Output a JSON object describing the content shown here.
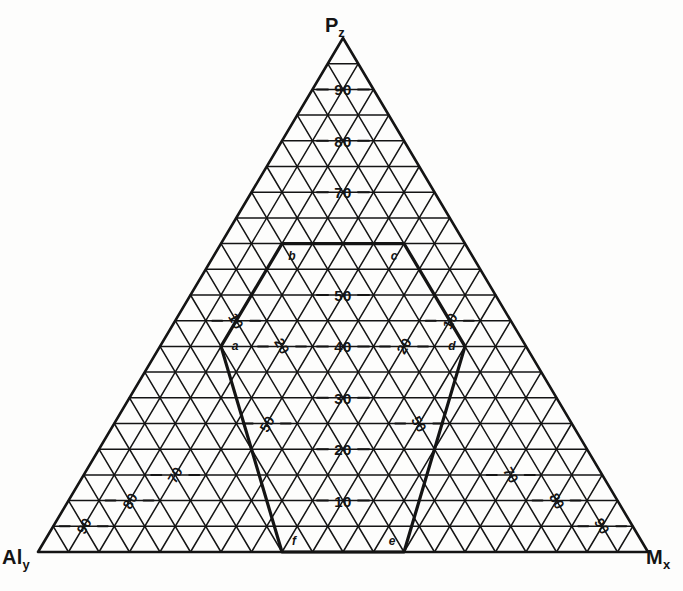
{
  "figure": {
    "type": "ternary-diagram",
    "background": "#fdfdfc",
    "ink": "#141414"
  },
  "corners": {
    "apex": {
      "name": "P",
      "sub": "z",
      "label": "Pz"
    },
    "bottom_left": {
      "name": "Al",
      "sub": "y",
      "label": "Aly"
    },
    "bottom_right": {
      "name": "M",
      "sub": "x",
      "label": "Mx"
    }
  },
  "chart_data": {
    "type": "ternary",
    "title": "",
    "axes": [
      {
        "id": "P",
        "label": "Pz",
        "position": "center",
        "ticks": [
          10,
          20,
          30,
          40,
          50,
          60,
          70,
          80,
          90
        ],
        "labeled_ticks": [
          "10",
          "20",
          "30",
          "40",
          "50",
          "70",
          "80",
          "90"
        ]
      },
      {
        "id": "Al",
        "label": "Aly",
        "position": "left",
        "ticks": [
          10,
          20,
          30,
          40,
          50,
          60,
          70,
          80,
          90
        ],
        "labeled_ticks": [
          "10",
          "20",
          "50",
          "70",
          "80",
          "90"
        ]
      },
      {
        "id": "M",
        "label": "Mx",
        "position": "right",
        "ticks": [
          10,
          20,
          30,
          40,
          50,
          60,
          70,
          80,
          90
        ],
        "labeled_ticks": [
          "10",
          "20",
          "50",
          "70",
          "80",
          "90"
        ]
      }
    ],
    "grid": {
      "on": true,
      "divisions": 20,
      "families": 3
    },
    "region": {
      "name": "abcdef",
      "style": "bold-outline",
      "vertices": [
        {
          "id": "a",
          "label": "a"
        },
        {
          "id": "b",
          "label": "b"
        },
        {
          "id": "c",
          "label": "c"
        },
        {
          "id": "d",
          "label": "d"
        },
        {
          "id": "e",
          "label": "e"
        },
        {
          "id": "f",
          "label": "f"
        }
      ]
    }
  },
  "center_ticks": [
    {
      "value": "90",
      "t": 0.9
    },
    {
      "value": "80",
      "t": 0.8
    },
    {
      "value": "70",
      "t": 0.7
    },
    {
      "value": "50",
      "t": 0.5
    },
    {
      "value": "40",
      "t": 0.4
    },
    {
      "value": "30",
      "t": 0.3
    },
    {
      "value": "20",
      "t": 0.2
    },
    {
      "value": "10",
      "t": 0.1
    }
  ],
  "left_ticks": [
    {
      "value": "10",
      "t": 0.1
    },
    {
      "value": "20",
      "t": 0.2
    },
    {
      "value": "50",
      "t": 0.5
    },
    {
      "value": "70",
      "t": 0.7
    },
    {
      "value": "80",
      "t": 0.8
    },
    {
      "value": "90",
      "t": 0.9
    }
  ],
  "right_ticks": [
    {
      "value": "10",
      "t": 0.1
    },
    {
      "value": "20",
      "t": 0.2
    },
    {
      "value": "50",
      "t": 0.5
    },
    {
      "value": "70",
      "t": 0.7
    },
    {
      "value": "80",
      "t": 0.8
    },
    {
      "value": "90",
      "t": 0.9
    }
  ],
  "vertex_labels": {
    "a": "a",
    "b": "b",
    "c": "c",
    "d": "d",
    "e": "e",
    "f": "f"
  }
}
